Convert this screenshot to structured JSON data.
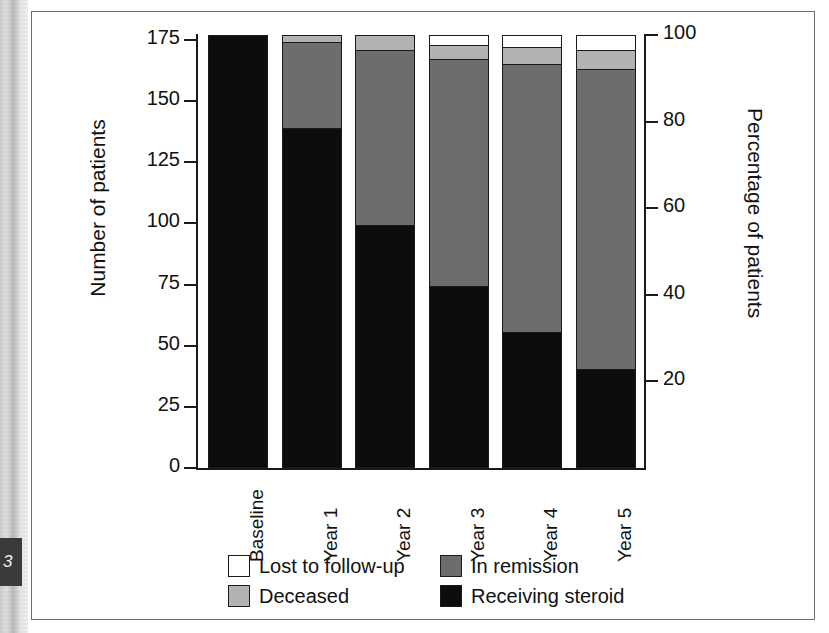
{
  "page": {
    "page_number_fragment": "3"
  },
  "chart_data": {
    "type": "bar",
    "subtype": "stacked-bar",
    "title": "",
    "xlabel": "",
    "ylabel": "Number of patients",
    "y2label": "Percentage of patients",
    "categories": [
      "Baseline",
      "Year 1",
      "Year 2",
      "Year 3",
      "Year 4",
      "Year 5"
    ],
    "ylim": [
      0,
      177
    ],
    "y2lim": [
      0,
      100
    ],
    "yticks": [
      0,
      25,
      50,
      75,
      100,
      125,
      150,
      175
    ],
    "y2ticks": [
      20,
      40,
      60,
      80,
      100
    ],
    "grid": false,
    "legend_position": "bottom",
    "total_patients": 177,
    "series": [
      {
        "name": "Receiving steroid",
        "color": "#0d0d0d",
        "values": [
          177,
          139,
          99,
          74,
          55,
          40
        ]
      },
      {
        "name": "In remission",
        "color": "#6d6d6d",
        "values": [
          0,
          35,
          72,
          93,
          110,
          123
        ]
      },
      {
        "name": "Deceased",
        "color": "#b2b2b2",
        "values": [
          0,
          3,
          6,
          6,
          7,
          8
        ]
      },
      {
        "name": "Lost to follow-up",
        "color": "#ffffff",
        "values": [
          0,
          0,
          0,
          4,
          5,
          6
        ]
      }
    ],
    "legend": [
      {
        "label": "Lost to follow-up",
        "color": "#ffffff"
      },
      {
        "label": "In remission",
        "color": "#6d6d6d"
      },
      {
        "label": "Deceased",
        "color": "#b2b2b2"
      },
      {
        "label": "Receiving steroid",
        "color": "#0d0d0d"
      }
    ]
  }
}
